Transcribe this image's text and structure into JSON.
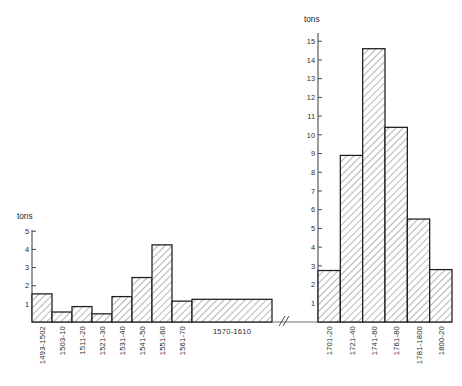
{
  "figure": {
    "width": 462,
    "height": 386,
    "background": "#ffffff",
    "axis_color": "#4a4a4a",
    "bar_stroke": "#1c1c1c",
    "bar_fill_pattern": "diagonal-hatch",
    "axis_break_symbol": "//"
  },
  "chart_data": [
    {
      "type": "bar",
      "id": "left-histogram",
      "title": "",
      "subtitle": "",
      "xlabel": "",
      "ylabel": "tons",
      "ylim": [
        0,
        5.4
      ],
      "yticks": [
        1,
        2,
        3,
        4,
        5
      ],
      "ytick_labels": [
        "1",
        "2",
        "3",
        "4",
        "5"
      ],
      "grid": false,
      "legend": "none",
      "categories": [
        "1493-1502",
        "1503-10",
        "1511-20",
        "1521-30",
        "1531-40",
        "1541-50",
        "1551-60",
        "1561-70",
        "1570-1610"
      ],
      "values": [
        1.55,
        0.55,
        0.85,
        0.45,
        1.4,
        2.45,
        4.25,
        1.15,
        1.25
      ],
      "bar_widths": [
        1,
        1,
        1,
        1,
        1,
        1,
        1,
        1,
        4
      ],
      "label_orientation": [
        "vertical",
        "vertical",
        "vertical",
        "vertical",
        "vertical",
        "vertical",
        "vertical",
        "vertical",
        "horizontal"
      ],
      "annotations": []
    },
    {
      "type": "bar",
      "id": "right-histogram",
      "title": "",
      "subtitle": "",
      "xlabel": "",
      "ylabel": "tons",
      "ylim": [
        0,
        15.6
      ],
      "yticks": [
        1,
        2,
        3,
        4,
        5,
        6,
        7,
        8,
        9,
        10,
        11,
        12,
        13,
        14,
        15
      ],
      "ytick_labels": [
        "1",
        "2",
        "3",
        "4",
        "5",
        "6",
        "7",
        "8",
        "9",
        "10",
        "11",
        "12",
        "13",
        "14",
        "15"
      ],
      "grid": false,
      "legend": "none",
      "categories": [
        "1701-20",
        "1721-40",
        "1741-60",
        "1761-80",
        "1781-1800",
        "1800-20"
      ],
      "values": [
        2.75,
        8.9,
        14.6,
        10.4,
        5.5,
        2.8
      ],
      "bar_widths": [
        1,
        1,
        1,
        1,
        1,
        1
      ],
      "label_orientation": [
        "vertical",
        "vertical",
        "vertical",
        "vertical",
        "vertical",
        "vertical"
      ],
      "annotations": []
    }
  ]
}
